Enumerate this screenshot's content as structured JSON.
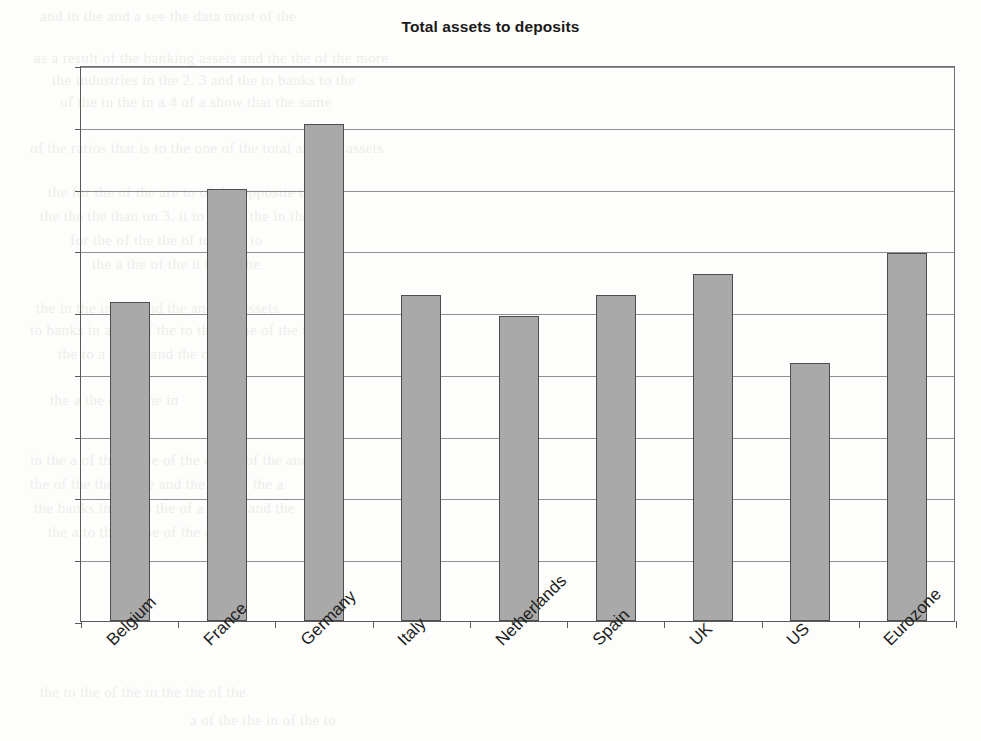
{
  "chart_data": {
    "type": "bar",
    "title": "Total assets to deposits",
    "xlabel": "",
    "ylabel": "",
    "categories": [
      "Belgium",
      "France",
      "Germany",
      "Italy",
      "Netherlands",
      "Spain",
      "UK",
      "US",
      "Eurozone"
    ],
    "values": [
      2.58,
      3.5,
      4.02,
      2.64,
      2.47,
      2.64,
      2.81,
      2.09,
      2.98
    ],
    "ylim": [
      0,
      4.5
    ],
    "ytick_labels": [
      "0",
      "0.5",
      "1",
      "1.5",
      "2",
      "2.5",
      "3",
      "3.5",
      "4",
      "4.5"
    ],
    "ytick_values": [
      0,
      0.5,
      1,
      1.5,
      2,
      2.5,
      3,
      3.5,
      4,
      4.5
    ],
    "grid": true,
    "legend": false,
    "legend_position": "none",
    "series": [
      {
        "name": "Total assets to deposits",
        "values": [
          2.58,
          3.5,
          4.02,
          2.64,
          2.47,
          2.64,
          2.81,
          2.09,
          2.98
        ],
        "bar_color": "#a9a9a9",
        "bar_edge_color": "#4d4d4d"
      }
    ]
  },
  "colors": {
    "bar_fill": "#a9a9a9",
    "bar_edge": "#4d4d4d",
    "gridline": "#8f8f8f",
    "axis": "#5a5a5a",
    "text": "#1d1d1d",
    "background": "#fdfdfc"
  },
  "background_bleed": [
    {
      "text": "and in the and a see the data most of the",
      "x": 40,
      "y": 8
    },
    {
      "text": "as a result of the banking assets and the the of the more",
      "x": 34,
      "y": 50
    },
    {
      "text": "the industries in the 2. 3 and the to banks to the",
      "x": 52,
      "y": 72
    },
    {
      "text": "of the in the in a 4 of a show that the same",
      "x": 60,
      "y": 94
    },
    {
      "text": "of the ratios that is to the one of the total and the assets",
      "x": 30,
      "y": 140
    },
    {
      "text": "the for the of the are to of the opposite the",
      "x": 48,
      "y": 184
    },
    {
      "text": "the the the than on 3. it to the of the in the",
      "x": 40,
      "y": 208
    },
    {
      "text": "for the of the the of to the a to",
      "x": 70,
      "y": 232
    },
    {
      "text": "the a the of the it be in the",
      "x": 92,
      "y": 256
    },
    {
      "text": "the in the in the and the and the assets",
      "x": 36,
      "y": 300
    },
    {
      "text": "to banks in a the of the to the in the of the in the",
      "x": 30,
      "y": 322
    },
    {
      "text": "the to a of the and the of the",
      "x": 58,
      "y": 346
    },
    {
      "text": "the a the of to the in",
      "x": 50,
      "y": 392
    },
    {
      "text": "in the a of the in the of the of the of the and",
      "x": 30,
      "y": 452
    },
    {
      "text": "the of the the to the and the a is of the a",
      "x": 30,
      "y": 476
    },
    {
      "text": "the banks in the to the of a in the and the",
      "x": 34,
      "y": 500
    },
    {
      "text": "the a to the in the of the and",
      "x": 48,
      "y": 524
    },
    {
      "text": "the to the of the in the the of the",
      "x": 40,
      "y": 684
    },
    {
      "text": "a of the the in of the to",
      "x": 190,
      "y": 712
    }
  ]
}
